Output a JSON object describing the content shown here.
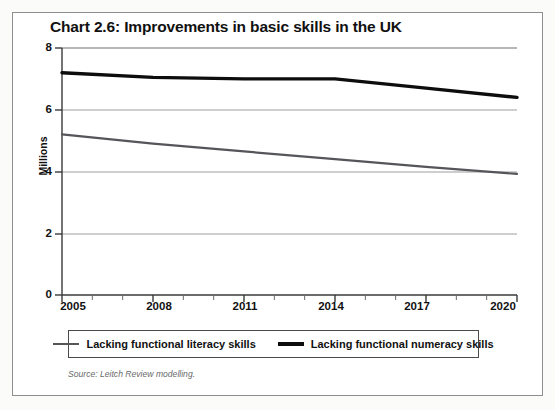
{
  "figure": {
    "title": "Chart 2.6: Improvements in basic skills in the UK",
    "source_note": "Source: Leitch Review modelling."
  },
  "legend": {
    "items": [
      {
        "label": "Lacking functional literacy skills",
        "color": "#55565a"
      },
      {
        "label": "Lacking functional numeracy skills",
        "color": "#0d0d0d"
      }
    ]
  },
  "axes": {
    "y_title": "Millions",
    "y_ticks": [
      "0",
      "2",
      "4",
      "6",
      "8"
    ],
    "x_ticks": [
      "2005",
      "2008",
      "2011",
      "2014",
      "2017",
      "2020"
    ]
  },
  "chart_data": {
    "type": "line",
    "title": "Chart 2.6: Improvements in basic skills in the UK",
    "xlabel": "",
    "ylabel": "Millions",
    "xlim": [
      2005,
      2020
    ],
    "ylim": [
      0,
      8
    ],
    "ytick_values": [
      0,
      2,
      4,
      6,
      8
    ],
    "xtick_values": [
      2005,
      2008,
      2011,
      2014,
      2017,
      2020
    ],
    "x_minor_ticks": [
      2006,
      2007,
      2009,
      2010,
      2012,
      2013,
      2015,
      2016,
      2018,
      2019
    ],
    "grid": "horizontal",
    "legend_position": "below-plot",
    "x": [
      2005,
      2008,
      2011,
      2014,
      2017,
      2020
    ],
    "series": [
      {
        "name": "Lacking functional literacy skills",
        "color": "#55565a",
        "linewidth": 2.2,
        "values": [
          5.2,
          4.9,
          4.65,
          4.4,
          4.15,
          3.92
        ]
      },
      {
        "name": "Lacking functional numeracy skills",
        "color": "#0d0d0d",
        "linewidth": 3.4,
        "values": [
          7.2,
          7.05,
          7.0,
          7.0,
          6.7,
          6.4
        ]
      }
    ],
    "annotations": [
      "Source: Leitch Review modelling."
    ]
  }
}
